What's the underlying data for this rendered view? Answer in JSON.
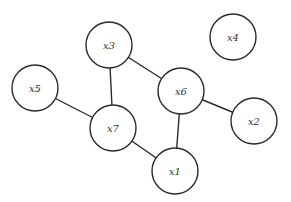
{
  "diagram": {
    "type": "undirected-graph",
    "node_radius": 23,
    "stroke_color": "#2b2b2b",
    "nodes": [
      {
        "id": "x1",
        "label": "x1",
        "cx": 175,
        "cy": 171
      },
      {
        "id": "x2",
        "label": "x2",
        "cx": 254,
        "cy": 121
      },
      {
        "id": "x3",
        "label": "x3",
        "cx": 109,
        "cy": 45
      },
      {
        "id": "x4",
        "label": "x4",
        "cx": 233,
        "cy": 37
      },
      {
        "id": "x5",
        "label": "x5",
        "cx": 35,
        "cy": 88
      },
      {
        "id": "x6",
        "label": "x6",
        "cx": 181,
        "cy": 91
      },
      {
        "id": "x7",
        "label": "x7",
        "cx": 113,
        "cy": 128
      }
    ],
    "edges": [
      {
        "from": "x3",
        "to": "x6"
      },
      {
        "from": "x3",
        "to": "x7"
      },
      {
        "from": "x5",
        "to": "x7"
      },
      {
        "from": "x6",
        "to": "x2"
      },
      {
        "from": "x6",
        "to": "x1"
      },
      {
        "from": "x7",
        "to": "x1"
      }
    ]
  }
}
